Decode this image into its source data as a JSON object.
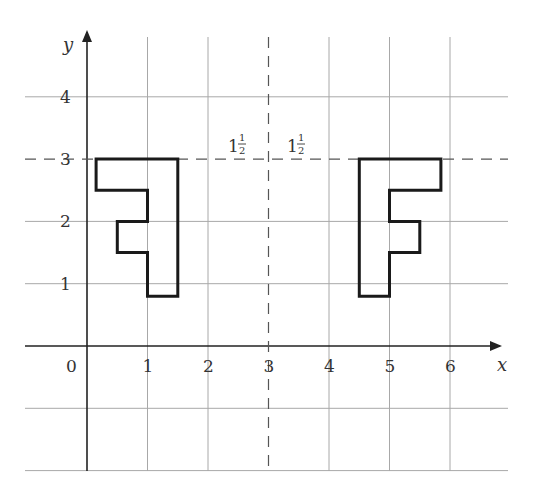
{
  "diagram": {
    "type": "reflection",
    "x_axis_label": "x",
    "y_axis_label": "y",
    "x_ticks": [
      "0",
      "1",
      "2",
      "3",
      "4",
      "5",
      "6"
    ],
    "y_ticks": [
      "1",
      "2",
      "3",
      "4"
    ],
    "distance_labels": [
      {
        "whole": "1",
        "num": "1",
        "den": "2"
      },
      {
        "whole": "1",
        "num": "1",
        "den": "2"
      }
    ],
    "mirror_lines": [
      {
        "orientation": "vertical",
        "at": 3
      },
      {
        "orientation": "horizontal",
        "at": 3
      }
    ],
    "shapes": {
      "original_F": [
        [
          4.5,
          3
        ],
        [
          5.85,
          3
        ],
        [
          5.85,
          2.5
        ],
        [
          5,
          2.5
        ],
        [
          5,
          2
        ],
        [
          5.5,
          2
        ],
        [
          5.5,
          1.5
        ],
        [
          5,
          1.5
        ],
        [
          5,
          0.8
        ],
        [
          4.5,
          0.8
        ]
      ],
      "reflected_F": [
        [
          1.5,
          3
        ],
        [
          0.15,
          3
        ],
        [
          0.15,
          2.5
        ],
        [
          1,
          2.5
        ],
        [
          1,
          2
        ],
        [
          0.5,
          2
        ],
        [
          0.5,
          1.5
        ],
        [
          1,
          1.5
        ],
        [
          1,
          0.8
        ],
        [
          1.5,
          0.8
        ]
      ]
    },
    "colors": {
      "shape_stroke": "#1a1a1a",
      "grid": "#a8a8a8",
      "axis": "#222222"
    }
  }
}
